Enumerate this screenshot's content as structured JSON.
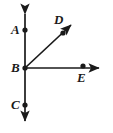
{
  "figure": {
    "background_color": "#ffffff",
    "stroke_color": "#1a1a1a",
    "label_color": "#1a1a1a",
    "width": 113,
    "height": 133,
    "points": [
      {
        "id": "A",
        "label": "A",
        "x": 25,
        "y": 30,
        "marker": "dot"
      },
      {
        "id": "B",
        "label": "B",
        "x": 25,
        "y": 68,
        "marker": "dot"
      },
      {
        "id": "C",
        "label": "C",
        "x": 25,
        "y": 105,
        "marker": "dot"
      },
      {
        "id": "D",
        "label": "D",
        "x": 63,
        "y": 33,
        "marker": "dot"
      },
      {
        "id": "E",
        "label": "E",
        "x": 83,
        "y": 68,
        "marker": "dot"
      }
    ],
    "lines": [
      {
        "id": "line-AC",
        "name": "vertical-line-through-A-B-C",
        "x1": 25,
        "y1": 10,
        "x2": 25,
        "y2": 125,
        "arrow_start": true,
        "arrow_end": true
      },
      {
        "id": "ray-BE",
        "name": "horizontal-ray-B-to-E",
        "x1": 25,
        "y1": 68,
        "x2": 103,
        "y2": 68,
        "arrow_start": false,
        "arrow_end": true
      },
      {
        "id": "ray-BD",
        "name": "diagonal-ray-B-to-D",
        "x1": 25,
        "y1": 68,
        "x2": 74,
        "y2": 22,
        "arrow_start": false,
        "arrow_end": true
      }
    ]
  }
}
